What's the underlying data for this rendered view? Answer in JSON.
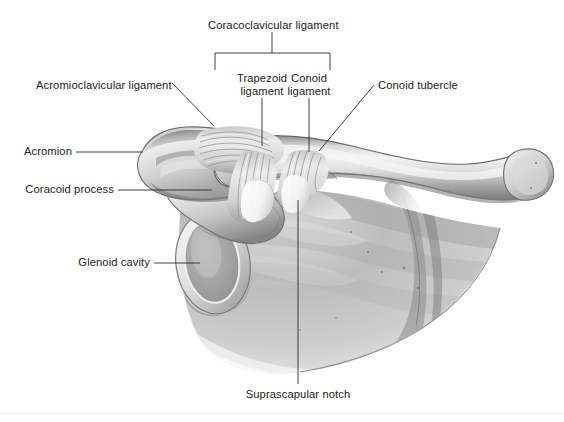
{
  "figure": {
    "type": "anatomical-illustration",
    "width": 564,
    "height": 422,
    "background_color": "#ffffff",
    "ink_color": "#1b1b1b",
    "bone_light": "#f2f2f2",
    "bone_mid": "#bdbdbd",
    "bone_dark": "#6e6e6e"
  },
  "labels": {
    "coracoclavicular_ligament": "Coracoclavicular ligament",
    "trapezoid_ligament_line1": "Trapezoid",
    "trapezoid_ligament_line2": "ligament",
    "conoid_ligament_line1": "Conoid",
    "conoid_ligament_line2": "ligament",
    "conoid_tubercle": "Conoid tubercle",
    "acromioclavicular_ligament": "Acromioclavicular ligament",
    "acromion": "Acromion",
    "coracoid_process": "Coracoid process",
    "glenoid_cavity": "Glenoid cavity",
    "suprascapular_notch": "Suprascapular notch"
  },
  "structures": [
    "clavicle",
    "acromion",
    "coracoid process",
    "glenoid cavity",
    "scapula body",
    "trapezoid ligament",
    "conoid ligament",
    "acromioclavicular ligament",
    "suprascapular notch",
    "conoid tubercle"
  ]
}
